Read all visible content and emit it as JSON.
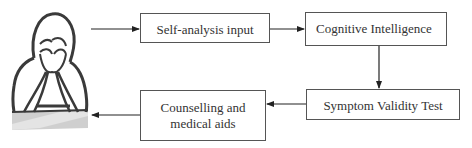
{
  "diagram": {
    "type": "flowchart",
    "figure": {
      "icon": "distressed-person-icon",
      "description": "Person holding head in hands"
    },
    "nodes": [
      {
        "id": "self_analysis",
        "label": "Self-analysis input"
      },
      {
        "id": "cognitive",
        "label": "Cognitive Intelligence"
      },
      {
        "id": "svt",
        "label": "Symptom Validity Test"
      },
      {
        "id": "counselling",
        "label": "Counselling and\nmedical aids"
      }
    ],
    "edges": [
      {
        "from": "person",
        "to": "self_analysis"
      },
      {
        "from": "self_analysis",
        "to": "cognitive"
      },
      {
        "from": "cognitive",
        "to": "svt"
      },
      {
        "from": "svt",
        "to": "counselling"
      },
      {
        "from": "counselling",
        "to": "person"
      }
    ],
    "colors": {
      "line": "#222222",
      "box_border": "#555555",
      "text": "#333333"
    }
  }
}
